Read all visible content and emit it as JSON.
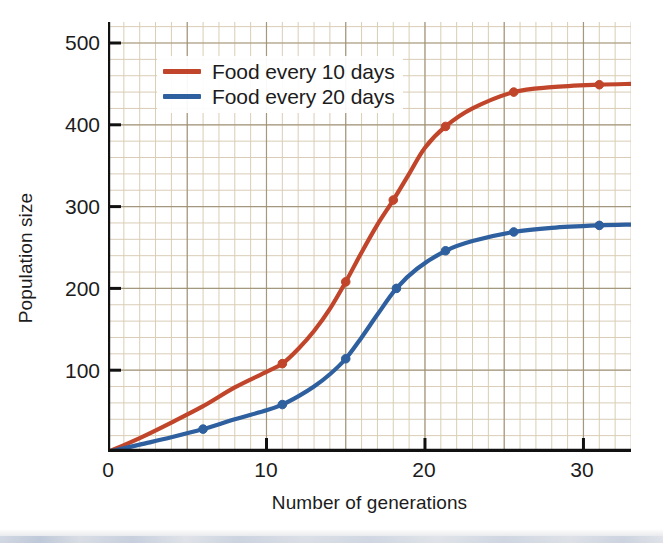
{
  "chart_data": {
    "type": "line",
    "title": "",
    "xlabel": "Number of generations",
    "ylabel": "Population size",
    "xlim": [
      0,
      33
    ],
    "ylim": [
      0,
      520
    ],
    "xticks": [
      0,
      10,
      20,
      30
    ],
    "yticks": [
      100,
      200,
      300,
      400,
      500
    ],
    "xtick_labels": [
      "0",
      "10",
      "20",
      "30"
    ],
    "ytick_labels": [
      "100",
      "200",
      "300",
      "400",
      "500"
    ],
    "grid": "graph-paper minor grid every 1 unit x / 20 population, major grid every 5 units x / 100 population",
    "legend_position": "upper-left inside axes",
    "series": [
      {
        "name": "Food every 10 days",
        "color": "#c0452a",
        "marker": "circle",
        "markers_x": [
          11,
          15,
          18,
          21.3,
          25.6,
          31
        ],
        "markers_y": [
          108,
          208,
          308,
          398,
          440,
          449
        ],
        "x": [
          0,
          2,
          4,
          6,
          8,
          10,
          11,
          12,
          13,
          14,
          15,
          16,
          17,
          18,
          19,
          20,
          21.3,
          23,
          25.6,
          28,
          31,
          33
        ],
        "y": [
          0,
          17,
          36,
          56,
          79,
          98,
          108,
          126,
          148,
          175,
          208,
          244,
          278,
          308,
          340,
          372,
          398,
          420,
          440,
          446,
          449,
          450
        ]
      },
      {
        "name": "Food every 20 days",
        "color": "#2e5f9e",
        "marker": "circle",
        "markers_x": [
          6,
          11,
          15,
          18.2,
          21.3,
          25.6,
          31
        ],
        "markers_y": [
          28,
          58,
          114,
          200,
          246,
          269,
          277
        ],
        "x": [
          0,
          2,
          4,
          6,
          8,
          10,
          11,
          12,
          13,
          14,
          15,
          16,
          17,
          18.2,
          19.5,
          21.3,
          23,
          25.6,
          28,
          31,
          33
        ],
        "y": [
          0,
          9,
          18,
          28,
          40,
          51,
          58,
          68,
          80,
          95,
          114,
          140,
          168,
          200,
          224,
          246,
          258,
          269,
          274,
          277,
          278
        ]
      }
    ]
  },
  "legend": {
    "items": [
      {
        "label": "Food every 10 days",
        "color": "#c0452a"
      },
      {
        "label": "Food every 20 days",
        "color": "#2e5f9e"
      }
    ]
  },
  "axes": {
    "x_title": "Number of generations",
    "y_title": "Population size",
    "x_tick_labels": [
      "0",
      "10",
      "20",
      "30"
    ],
    "y_tick_labels": [
      "100",
      "200",
      "300",
      "400",
      "500"
    ]
  },
  "colors": {
    "series_1": "#c0452a",
    "series_2": "#2e5f9e",
    "axis": "#111111",
    "grid_minor": "#d9cdb6",
    "grid_major": "#9b8e75",
    "background": "#ffffff",
    "text": "#1c1c1c"
  }
}
